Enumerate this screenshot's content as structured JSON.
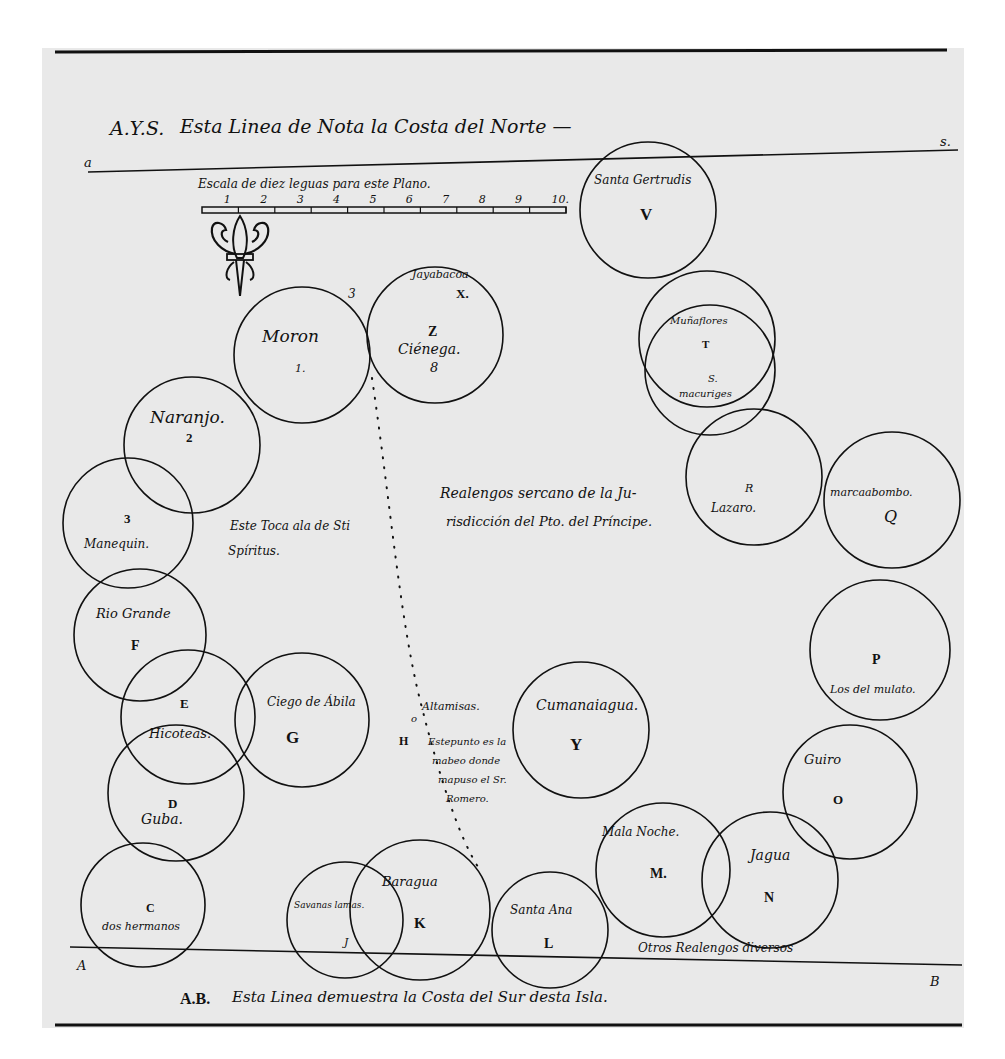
{
  "document": {
    "background": "#e9e9e9",
    "ink": "#111111",
    "top_heading": {
      "prefix": "A.Y.S.",
      "text": "Esta Linea de Nota la Costa del Norte —",
      "left_marker": "a",
      "right_marker": "s."
    },
    "bottom_heading": {
      "prefix": "A.B.",
      "text": "Esta Linea demuestra la Costa del Sur desta Isla.",
      "left_marker": "A",
      "right_marker": "B"
    },
    "scale": {
      "caption": "Escala de diez leguas para este Plano.",
      "ticks": [
        "1",
        "2",
        "3",
        "4",
        "5",
        "6",
        "7",
        "8",
        "9",
        "10."
      ]
    },
    "compass": {
      "icon": "fleur-de-lis-icon"
    },
    "center_note": {
      "line1": "Realengos sercano de la Ju-",
      "line2": "risdicción del Pto. del Príncipe."
    },
    "sancti_spiritus_note": {
      "line1": "Este Toca ala de Sti",
      "line2": "Spíritus."
    },
    "altamisas_note": {
      "title": "Altamisas.",
      "marker": "H",
      "circle_mark": "o",
      "line1": "Estepunto es la",
      "line2": "mabeo donde",
      "line3": "mapuso el Sr.",
      "line4": "Romero."
    },
    "bottom_note": "Otros Realengos diversos",
    "sites": [
      {
        "id": "V",
        "name": "Santa Gertrudis",
        "letter": "V"
      },
      {
        "id": "X",
        "name": "Jayabacoa",
        "letter": "X."
      },
      {
        "id": "Z",
        "name": "Ciénega.",
        "letter": "Z",
        "number": "8"
      },
      {
        "id": "1",
        "name": "Moron",
        "letter": "1.",
        "number": "3"
      },
      {
        "id": "2",
        "name": "Naranjo.",
        "letter": "2"
      },
      {
        "id": "3",
        "name": "Manequin.",
        "letter": "3"
      },
      {
        "id": "F",
        "name": "Rio Grande",
        "letter": "F"
      },
      {
        "id": "E",
        "name": "Hicoteas.",
        "letter": "E"
      },
      {
        "id": "G",
        "name": "Ciego de Ábila",
        "letter": "G"
      },
      {
        "id": "D",
        "name": "Guba.",
        "letter": "D"
      },
      {
        "id": "C",
        "name": "dos hermanos",
        "letter": "C"
      },
      {
        "id": "J",
        "name": "Savanas lamas.",
        "letter": "J"
      },
      {
        "id": "K",
        "name": "Baragua",
        "letter": "K"
      },
      {
        "id": "L",
        "name": "Santa Ana",
        "letter": "L"
      },
      {
        "id": "Y",
        "name": "Cumanaiagua.",
        "letter": "Y"
      },
      {
        "id": "M",
        "name": "Mala Noche.",
        "letter": "M."
      },
      {
        "id": "N",
        "name": "Jagua",
        "letter": "N"
      },
      {
        "id": "O",
        "name": "Guiro",
        "letter": "O"
      },
      {
        "id": "P",
        "name": "Los del mulato.",
        "letter": "P"
      },
      {
        "id": "Q",
        "name": "marcaabombo.",
        "letter": "Q"
      },
      {
        "id": "R",
        "name": "Lazaro.",
        "letter": "R"
      },
      {
        "id": "T",
        "name": "Muñaflores",
        "letter": "T"
      },
      {
        "id": "S",
        "name": "macuriges",
        "letter": "S."
      }
    ]
  }
}
